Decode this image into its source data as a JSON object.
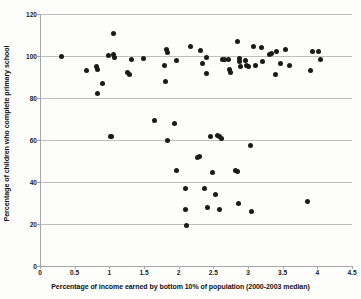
{
  "chart_data": {
    "type": "scatter",
    "title": "",
    "xlabel": "Percentage of income earned by bottom 10% of population (2000-2003 median)",
    "ylabel": "Percentage of children who complete primary school",
    "xlim": [
      0,
      4.5
    ],
    "ylim": [
      0,
      120
    ],
    "xticks": [
      0,
      0.5,
      1,
      1.5,
      2,
      2.5,
      3,
      3.5,
      4,
      4.5
    ],
    "xtick_labels": [
      "0",
      "0.5",
      "1",
      "1.5",
      "2",
      "2.5",
      "3",
      "3.5",
      "4",
      "4.5"
    ],
    "yticks": [
      0,
      20,
      40,
      60,
      80,
      100,
      120
    ],
    "ytick_labels": [
      "0",
      "20",
      "40",
      "60",
      "80",
      "100",
      "120"
    ],
    "grid": "horizontal",
    "legend": "none",
    "marker_color": "#1a1a1a",
    "marker_shape": "circle",
    "series": [
      {
        "name": "Countries",
        "points": [
          [
            0.3,
            100.0
          ],
          [
            0.65,
            93.0
          ],
          [
            0.8,
            95.0
          ],
          [
            0.81,
            93.5
          ],
          [
            0.82,
            82.0
          ],
          [
            0.88,
            87.0
          ],
          [
            0.97,
            100.3
          ],
          [
            1.0,
            61.5
          ],
          [
            1.02,
            61.8
          ],
          [
            1.05,
            110.7
          ],
          [
            1.05,
            100.5
          ],
          [
            1.06,
            99.5
          ],
          [
            1.25,
            92.0
          ],
          [
            1.27,
            91.3
          ],
          [
            1.3,
            98.2
          ],
          [
            1.48,
            99.0
          ],
          [
            1.63,
            69.3
          ],
          [
            1.78,
            95.5
          ],
          [
            1.8,
            88.0
          ],
          [
            1.81,
            103.2
          ],
          [
            1.82,
            101.5
          ],
          [
            1.83,
            60.0
          ],
          [
            1.92,
            67.7
          ],
          [
            1.95,
            98.0
          ],
          [
            1.96,
            45.6
          ],
          [
            2.08,
            37.0
          ],
          [
            2.09,
            27.0
          ],
          [
            2.1,
            19.2
          ],
          [
            2.15,
            104.5
          ],
          [
            2.26,
            51.8
          ],
          [
            2.28,
            52.0
          ],
          [
            2.3,
            102.5
          ],
          [
            2.33,
            96.5
          ],
          [
            2.36,
            37.0
          ],
          [
            2.38,
            91.7
          ],
          [
            2.39,
            99.5
          ],
          [
            2.4,
            28.0
          ],
          [
            2.45,
            61.8
          ],
          [
            2.47,
            44.6
          ],
          [
            2.52,
            34.0
          ],
          [
            2.55,
            62.2
          ],
          [
            2.57,
            61.5
          ],
          [
            2.58,
            27.0
          ],
          [
            2.6,
            60.5
          ],
          [
            2.62,
            98.5
          ],
          [
            2.65,
            98.3
          ],
          [
            2.7,
            98.3
          ],
          [
            2.72,
            93.8
          ],
          [
            2.74,
            92.3
          ],
          [
            2.8,
            45.3
          ],
          [
            2.83,
            45.0
          ],
          [
            2.84,
            107.0
          ],
          [
            2.85,
            30.0
          ],
          [
            2.86,
            99.0
          ],
          [
            2.87,
            97.5
          ],
          [
            2.88,
            95.0
          ],
          [
            2.95,
            98.0
          ],
          [
            2.97,
            95.5
          ],
          [
            2.99,
            95.0
          ],
          [
            3.02,
            57.5
          ],
          [
            3.03,
            26.0
          ],
          [
            3.07,
            104.3
          ],
          [
            3.1,
            95.3
          ],
          [
            3.18,
            104.0
          ],
          [
            3.2,
            97.5
          ],
          [
            3.3,
            100.8
          ],
          [
            3.33,
            101.3
          ],
          [
            3.38,
            91.2
          ],
          [
            3.4,
            102.3
          ],
          [
            3.45,
            96.5
          ],
          [
            3.52,
            103.0
          ],
          [
            3.58,
            95.5
          ],
          [
            3.85,
            30.5
          ],
          [
            3.88,
            93.0
          ],
          [
            3.92,
            102.3
          ],
          [
            4.0,
            102.0
          ],
          [
            4.03,
            98.5
          ]
        ]
      }
    ]
  }
}
